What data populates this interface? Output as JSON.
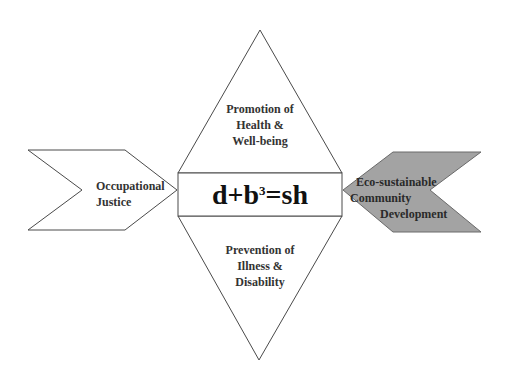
{
  "diagram": {
    "colors": {
      "stroke": "#4a4a4a",
      "fill_default": "#ffffff",
      "fill_eco": "#a3a3a3",
      "text": "#333333"
    },
    "formula": {
      "base": "d+b",
      "exponent": "3",
      "rest": "=sh"
    },
    "top_triangle": {
      "lines": [
        "Promotion of",
        "Health &",
        "Well-being"
      ]
    },
    "bottom_triangle": {
      "lines": [
        "Prevention of",
        "Illness &",
        "Disability"
      ]
    },
    "left_chevron": {
      "lines": [
        "Occupational",
        "Justice"
      ]
    },
    "right_chevron": {
      "lines": [
        "Eco-sustainable",
        "Community",
        "Development"
      ]
    }
  }
}
